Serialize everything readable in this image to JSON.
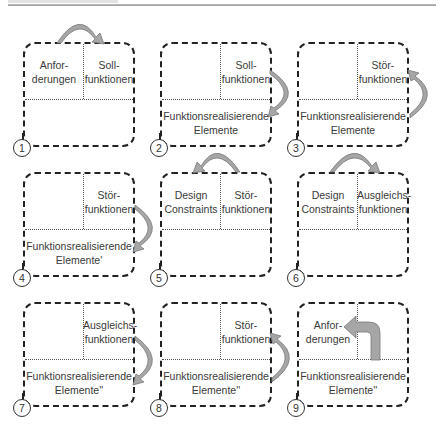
{
  "steps": [
    {
      "number": "1",
      "top_left": [
        "Anfor-",
        "derungen"
      ],
      "top_right": [
        "Soll-",
        "funktionen"
      ],
      "bottom": [
        "",
        ""
      ]
    },
    {
      "number": "2",
      "top_left": [
        "",
        ""
      ],
      "top_right": [
        "Soll-",
        "funktionen"
      ],
      "bottom": [
        "Funktionsrealisierende",
        "Elemente"
      ]
    },
    {
      "number": "3",
      "top_left": [
        "",
        ""
      ],
      "top_right": [
        "Stör-",
        "funktionen"
      ],
      "bottom": [
        "Funktionsrealisierende",
        "Elemente"
      ]
    },
    {
      "number": "4",
      "top_left": [
        "",
        ""
      ],
      "top_right": [
        "Stör-",
        "funktionen"
      ],
      "bottom": [
        "Funktionsrealisierende",
        "Elemente'"
      ]
    },
    {
      "number": "5",
      "top_left": [
        "Design",
        "Constraints"
      ],
      "top_right": [
        "Stör-",
        "funktionen"
      ],
      "bottom": [
        "",
        ""
      ]
    },
    {
      "number": "6",
      "top_left": [
        "Design",
        "Constraints"
      ],
      "top_right": [
        "Ausgleichs-",
        "funktionen"
      ],
      "bottom": [
        "",
        ""
      ]
    },
    {
      "number": "7",
      "top_left": [
        "",
        ""
      ],
      "top_right": [
        "Ausgleichs-",
        "funktionen"
      ],
      "bottom": [
        "Funktionsrealisierende",
        "Elemente''"
      ]
    },
    {
      "number": "8",
      "top_left": [
        "",
        ""
      ],
      "top_right": [
        "Stör-",
        "funktionen"
      ],
      "bottom": [
        "Funktionsrealisierende",
        "Elemente''"
      ]
    },
    {
      "number": "9",
      "top_left": [
        "Anfor-",
        "derungen"
      ],
      "top_right": [
        "",
        ""
      ],
      "bottom": [
        "Funktionsrealisierende",
        "Elemente''"
      ]
    }
  ],
  "arrows": [
    {
      "name": "arrow-1",
      "from": "Anforderungen",
      "to": "Sollfunktionen",
      "shape": "curved-over-top"
    },
    {
      "name": "arrow-2",
      "from": "Sollfunktionen",
      "to": "Funktionsrealisierende Elemente",
      "shape": "curved-right-down"
    },
    {
      "name": "arrow-3",
      "from": "Funktionsrealisierende Elemente",
      "to": "Störfunktionen",
      "shape": "curved-right-up"
    },
    {
      "name": "arrow-4",
      "from": "Störfunktionen",
      "to": "Funktionsrealisierende Elemente'",
      "shape": "curved-right-down"
    },
    {
      "name": "arrow-5",
      "from": "Störfunktionen",
      "to": "Design Constraints",
      "shape": "curved-over-top"
    },
    {
      "name": "arrow-6",
      "from": "Design Constraints",
      "to": "Ausgleichsfunktionen",
      "shape": "curved-over-top"
    },
    {
      "name": "arrow-7",
      "from": "Ausgleichsfunktionen",
      "to": "Funktionsrealisierende Elemente''",
      "shape": "curved-right-down"
    },
    {
      "name": "arrow-8",
      "from": "Funktionsrealisierende Elemente''",
      "to": "Störfunktionen",
      "shape": "curved-right-up"
    },
    {
      "name": "arrow-9",
      "from": "Funktionsrealisierende Elemente''",
      "to": "Anforderungen",
      "shape": "bent-up-left"
    }
  ],
  "colors": {
    "arrow_fill": "#a6a6a6",
    "arrow_stroke": "#7a7a7a",
    "border": "#222222"
  }
}
